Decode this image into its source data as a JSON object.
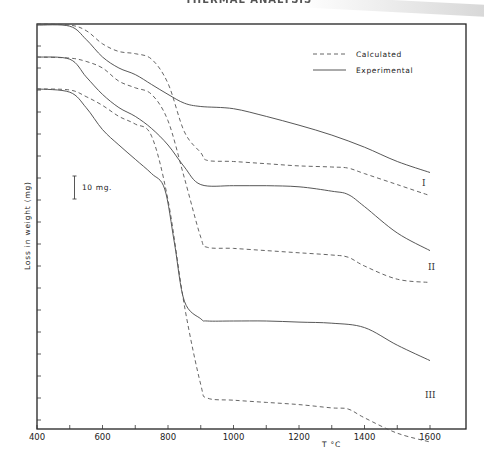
{
  "page": {
    "header_text": "THERMAL ANALYSIS"
  },
  "chart_data": {
    "type": "line",
    "title": "",
    "xlabel": "T °C",
    "ylabel": "Loss in weight (mg)",
    "xlim": [
      400,
      1710
    ],
    "x_ticks": [
      400,
      500,
      600,
      700,
      800,
      900,
      1000,
      1100,
      1200,
      1300,
      1400,
      1500,
      1600
    ],
    "x_tick_labels": [
      "400",
      "600",
      "800",
      "1000",
      "1200",
      "1400",
      "1600"
    ],
    "y_tick_labels": [],
    "scale_bar": {
      "label": "10 mg.",
      "value_mg": 10
    },
    "legend": [
      {
        "label": "Calculated",
        "style": "dashed"
      },
      {
        "label": "Experimental",
        "style": "solid"
      }
    ],
    "legend_position": "upper right",
    "grid": false,
    "curve_labels": [
      "I",
      "II",
      "III"
    ],
    "units_note": "y values are weight loss in mg measured downward from the top of the plot frame (curves are vertically offset)",
    "series": [
      {
        "name": "I Experimental",
        "curve": "I",
        "style": "solid",
        "x": [
          400,
          500,
          550,
          600,
          650,
          700,
          750,
          800,
          850,
          900,
          1000,
          1100,
          1200,
          1300,
          1400,
          1500,
          1600
        ],
        "y": [
          0.5,
          1,
          7,
          15,
          20,
          23,
          27.5,
          32,
          36,
          37.5,
          38.5,
          42,
          46,
          50.5,
          56,
          62.5,
          67.5
        ]
      },
      {
        "name": "I Calculated",
        "curve": "I",
        "style": "dashed",
        "x": [
          400,
          500,
          550,
          600,
          650,
          700,
          750,
          800,
          850,
          900,
          920,
          1000,
          1100,
          1200,
          1300,
          1350,
          1400,
          1500,
          1600
        ],
        "y": [
          0,
          0.5,
          3,
          9,
          12.5,
          13.5,
          16,
          27,
          49,
          58.5,
          62,
          62.5,
          63.5,
          64.5,
          65,
          65.5,
          68,
          73,
          78
        ]
      },
      {
        "name": "II Experimental",
        "curve": "II",
        "style": "solid",
        "x": [
          400,
          500,
          550,
          600,
          650,
          700,
          750,
          800,
          850,
          900,
          1000,
          1100,
          1200,
          1300,
          1350,
          1400,
          1500,
          1600
        ],
        "y": [
          15,
          16,
          24,
          32,
          38,
          42,
          47.5,
          55,
          65,
          73,
          73.5,
          73.5,
          74,
          76,
          77.5,
          83,
          95,
          103
        ]
      },
      {
        "name": "II Calculated",
        "curve": "II",
        "style": "dashed",
        "x": [
          400,
          500,
          550,
          600,
          650,
          700,
          750,
          800,
          850,
          900,
          920,
          1000,
          1100,
          1200,
          1300,
          1350,
          1400,
          1500,
          1600
        ],
        "y": [
          15,
          15.5,
          17,
          20,
          26,
          29,
          32,
          44,
          70,
          97,
          101.5,
          102,
          103,
          104,
          105,
          106,
          110,
          116,
          117.5
        ]
      },
      {
        "name": "III Experimental",
        "curve": "III",
        "style": "solid",
        "x": [
          400,
          500,
          550,
          600,
          650,
          700,
          750,
          790,
          820,
          850,
          900,
          920,
          1000,
          1100,
          1200,
          1300,
          1400,
          1500,
          1600
        ],
        "y": [
          29.5,
          31,
          38,
          48,
          55,
          61.5,
          68,
          75,
          100,
          126,
          134,
          135,
          135,
          135,
          135.5,
          136,
          138,
          146,
          153
        ]
      },
      {
        "name": "III Calculated",
        "curve": "III",
        "style": "dashed",
        "x": [
          400,
          500,
          550,
          600,
          650,
          700,
          750,
          800,
          850,
          900,
          920,
          1000,
          1100,
          1200,
          1300,
          1350,
          1400,
          1500,
          1600
        ],
        "y": [
          29.5,
          30,
          33,
          37,
          42,
          45.5,
          51,
          80,
          128,
          164,
          170,
          171,
          172,
          173,
          174.5,
          175,
          179,
          186,
          190
        ]
      }
    ]
  }
}
